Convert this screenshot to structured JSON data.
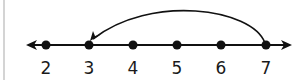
{
  "number_line": {
    "min_visible": 2,
    "max_visible": 7,
    "ticks": [
      {
        "value": 2,
        "label": "2",
        "x": 46
      },
      {
        "value": 3,
        "label": "3",
        "x": 89
      },
      {
        "value": 4,
        "label": "4",
        "x": 133
      },
      {
        "value": 5,
        "label": "5",
        "x": 177
      },
      {
        "value": 6,
        "label": "6",
        "x": 221
      },
      {
        "value": 7,
        "label": "7",
        "x": 266
      }
    ],
    "arrows_both_ends": true,
    "jump": {
      "from": 7,
      "to": 3,
      "direction": "left",
      "description": "curved arrow jumping back 4 units"
    },
    "line_color": "#111111",
    "point_color": "#111111"
  },
  "labels": {
    "t0": "2",
    "t1": "3",
    "t2": "4",
    "t3": "5",
    "t4": "6",
    "t5": "7"
  }
}
